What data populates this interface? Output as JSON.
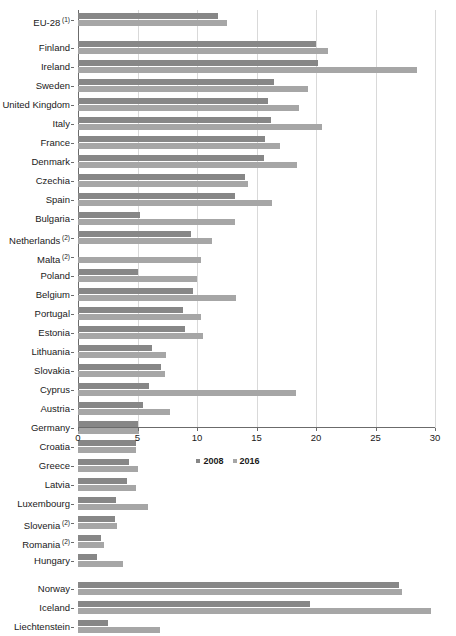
{
  "chart_data": {
    "type": "bar",
    "orientation": "horizontal",
    "title": "",
    "subtitle": "",
    "xlabel": "",
    "ylabel": "",
    "xlim": [
      0,
      30
    ],
    "xticks": [
      0,
      5,
      10,
      15,
      20,
      25,
      30
    ],
    "grid": true,
    "legend_position": "bottom",
    "legend": [
      "2008",
      "2016"
    ],
    "series": [
      {
        "name": "2008",
        "color": "#878787"
      },
      {
        "name": "2016",
        "color": "#a6a6a6"
      }
    ],
    "groups": [
      {
        "name": "aggregate",
        "rows": [
          {
            "category": "EU-28",
            "footnote": "1",
            "values": {
              "2008": 11.8,
              "2016": 12.5
            }
          }
        ]
      },
      {
        "name": "member-states",
        "rows": [
          {
            "category": "Finland",
            "footnote": "",
            "values": {
              "2008": 20.0,
              "2016": 21.0
            }
          },
          {
            "category": "Ireland",
            "footnote": "",
            "values": {
              "2008": 20.2,
              "2016": 28.5
            }
          },
          {
            "category": "Sweden",
            "footnote": "",
            "values": {
              "2008": 16.5,
              "2016": 19.3
            }
          },
          {
            "category": "United Kingdom",
            "footnote": "",
            "values": {
              "2008": 16.0,
              "2016": 18.6
            }
          },
          {
            "category": "Italy",
            "footnote": "",
            "values": {
              "2008": 16.2,
              "2016": 20.5
            }
          },
          {
            "category": "France",
            "footnote": "",
            "values": {
              "2008": 15.7,
              "2016": 17.0
            }
          },
          {
            "category": "Denmark",
            "footnote": "",
            "values": {
              "2008": 15.6,
              "2016": 18.4
            }
          },
          {
            "category": "Czechia",
            "footnote": "",
            "values": {
              "2008": 14.0,
              "2016": 14.3
            }
          },
          {
            "category": "Spain",
            "footnote": "",
            "values": {
              "2008": 13.2,
              "2016": 16.3
            }
          },
          {
            "category": "Bulgaria",
            "footnote": "",
            "values": {
              "2008": 5.2,
              "2016": 13.2
            }
          },
          {
            "category": "Netherlands",
            "footnote": "2",
            "values": {
              "2008": 9.5,
              "2016": 11.3
            }
          },
          {
            "category": "Malta",
            "footnote": "2",
            "values": {
              "2008": 0.0,
              "2016": 10.3
            }
          },
          {
            "category": "Poland",
            "footnote": "",
            "values": {
              "2008": 5.0,
              "2016": 10.0
            }
          },
          {
            "category": "Belgium",
            "footnote": "",
            "values": {
              "2008": 9.7,
              "2016": 13.3
            }
          },
          {
            "category": "Portugal",
            "footnote": "",
            "values": {
              "2008": 8.8,
              "2016": 10.3
            }
          },
          {
            "category": "Estonia",
            "footnote": "",
            "values": {
              "2008": 9.0,
              "2016": 10.5
            }
          },
          {
            "category": "Lithuania",
            "footnote": "",
            "values": {
              "2008": 6.2,
              "2016": 7.4
            }
          },
          {
            "category": "Slovakia",
            "footnote": "",
            "values": {
              "2008": 7.0,
              "2016": 7.3
            }
          },
          {
            "category": "Cyprus",
            "footnote": "",
            "values": {
              "2008": 6.0,
              "2016": 18.3
            }
          },
          {
            "category": "Austria",
            "footnote": "",
            "values": {
              "2008": 5.5,
              "2016": 7.7
            }
          },
          {
            "category": "Germany",
            "footnote": "",
            "values": {
              "2008": 5.0,
              "2016": 5.1
            }
          },
          {
            "category": "Croatia",
            "footnote": "",
            "values": {
              "2008": 4.9,
              "2016": 4.9
            }
          },
          {
            "category": "Greece",
            "footnote": "",
            "values": {
              "2008": 4.3,
              "2016": 5.0
            }
          },
          {
            "category": "Latvia",
            "footnote": "",
            "values": {
              "2008": 4.1,
              "2016": 4.9
            }
          },
          {
            "category": "Luxembourg",
            "footnote": "",
            "values": {
              "2008": 3.2,
              "2016": 5.9
            }
          },
          {
            "category": "Slovenia",
            "footnote": "2",
            "values": {
              "2008": 3.1,
              "2016": 3.3
            }
          },
          {
            "category": "Romania",
            "footnote": "2",
            "values": {
              "2008": 1.9,
              "2016": 2.2
            }
          },
          {
            "category": "Hungary",
            "footnote": "",
            "values": {
              "2008": 1.6,
              "2016": 3.8
            }
          }
        ]
      },
      {
        "name": "efta",
        "rows": [
          {
            "category": "Norway",
            "footnote": "",
            "values": {
              "2008": 27.0,
              "2016": 27.2
            }
          },
          {
            "category": "Iceland",
            "footnote": "",
            "values": {
              "2008": 19.5,
              "2016": 29.7
            }
          },
          {
            "category": "Liechtenstein",
            "footnote": "",
            "values": {
              "2008": 2.5,
              "2016": 6.9
            }
          }
        ]
      }
    ]
  }
}
